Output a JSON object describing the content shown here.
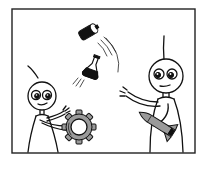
{
  "illustration": {
    "description": "Comic panel: two stick-figure robots playing catch with objects — a battery and a flask fly through the air from the right robot toward the left robot, who holds a gear; the right robot holds a rocket.",
    "left_figure": {
      "holding": "gear"
    },
    "right_figure": {
      "holding": "rocket"
    },
    "flying_objects": [
      "battery",
      "flask"
    ],
    "colors": {
      "ink": "#111111",
      "background": "#ffffff",
      "metal": "#9a9a9a"
    }
  }
}
